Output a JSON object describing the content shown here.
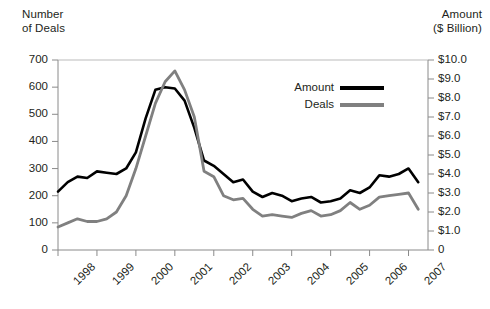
{
  "chart_data": {
    "type": "line",
    "title": "",
    "subtitle": "",
    "xlabel": "",
    "ylabel": "Number\nof Deals",
    "y2label": "Amount\n($ Billion)",
    "grid": false,
    "legend_position": "inside-top-right",
    "x_tick_labels": [
      "1998",
      "1999",
      "2000",
      "2001",
      "2002",
      "2003",
      "2004",
      "2005",
      "2006",
      "2007"
    ],
    "x_tick_values": [
      1998,
      1999,
      2000,
      2001,
      2002,
      2003,
      2004,
      2005,
      2006,
      2007
    ],
    "xlim": [
      1998,
      2007.5
    ],
    "left_axis": {
      "label": "Number of Deals",
      "ylim": [
        0,
        700
      ],
      "ticks": [
        0,
        100,
        200,
        300,
        400,
        500,
        600,
        700
      ],
      "tick_labels": [
        "0",
        "100",
        "200",
        "300",
        "400",
        "500",
        "600",
        "700"
      ]
    },
    "right_axis": {
      "label": "Amount ($ Billion)",
      "ylim": [
        0,
        10
      ],
      "ticks": [
        0,
        1,
        2,
        3,
        4,
        5,
        6,
        7,
        8,
        9,
        10
      ],
      "tick_labels": [
        "0",
        "$1.0",
        "$2.0",
        "$3.0",
        "$4.0",
        "$5.0",
        "$6.0",
        "$7.0",
        "$8.0",
        "$9.0",
        "$10.0"
      ]
    },
    "series": [
      {
        "name": "Amount",
        "axis": "right",
        "color": "#000000",
        "unit": "$ Billion",
        "x": [
          1998.0,
          1998.25,
          1998.5,
          1998.75,
          1999.0,
          1999.25,
          1999.5,
          1999.75,
          2000.0,
          2000.25,
          2000.5,
          2000.75,
          2001.0,
          2001.25,
          2001.5,
          2001.75,
          2002.0,
          2002.25,
          2002.5,
          2002.75,
          2003.0,
          2003.25,
          2003.5,
          2003.75,
          2004.0,
          2004.25,
          2004.5,
          2004.75,
          2005.0,
          2005.25,
          2005.5,
          2005.75,
          2006.0,
          2006.25,
          2006.5,
          2006.75,
          2007.0,
          2007.25
        ],
        "values": [
          3.07,
          3.57,
          3.86,
          3.79,
          4.14,
          4.07,
          4.0,
          4.29,
          5.14,
          6.93,
          8.43,
          8.57,
          8.5,
          7.86,
          6.43,
          4.71,
          4.43,
          4.0,
          3.57,
          3.71,
          3.07,
          2.79,
          3.0,
          2.86,
          2.57,
          2.71,
          2.79,
          2.5,
          2.57,
          2.71,
          3.14,
          3.0,
          3.29,
          3.93,
          3.86,
          4.0,
          4.29,
          3.57
        ],
        "values_deals_scale": [
          215,
          250,
          270,
          265,
          290,
          285,
          280,
          300,
          360,
          485,
          590,
          600,
          595,
          550,
          450,
          330,
          310,
          280,
          250,
          260,
          215,
          195,
          210,
          200,
          180,
          190,
          195,
          175,
          180,
          190,
          220,
          210,
          230,
          275,
          270,
          280,
          300,
          250
        ]
      },
      {
        "name": "Deals",
        "axis": "left",
        "color": "#808080",
        "unit": "Number of Deals",
        "x": [
          1998.0,
          1998.25,
          1998.5,
          1998.75,
          1999.0,
          1999.25,
          1999.5,
          1999.75,
          2000.0,
          2000.25,
          2000.5,
          2000.75,
          2001.0,
          2001.25,
          2001.5,
          2001.75,
          2002.0,
          2002.25,
          2002.5,
          2002.75,
          2003.0,
          2003.25,
          2003.5,
          2003.75,
          2004.0,
          2004.25,
          2004.5,
          2004.75,
          2005.0,
          2005.25,
          2005.5,
          2005.75,
          2006.0,
          2006.25,
          2006.5,
          2006.75,
          2007.0,
          2007.25
        ],
        "values": [
          85,
          100,
          115,
          105,
          105,
          115,
          140,
          200,
          300,
          420,
          540,
          620,
          660,
          590,
          490,
          290,
          270,
          200,
          185,
          190,
          150,
          125,
          130,
          125,
          120,
          135,
          145,
          125,
          130,
          145,
          175,
          150,
          165,
          195,
          200,
          205,
          210,
          150
        ]
      }
    ],
    "legend": [
      {
        "label": "Amount",
        "color": "#000000"
      },
      {
        "label": "Deals",
        "color": "#808080"
      }
    ]
  }
}
